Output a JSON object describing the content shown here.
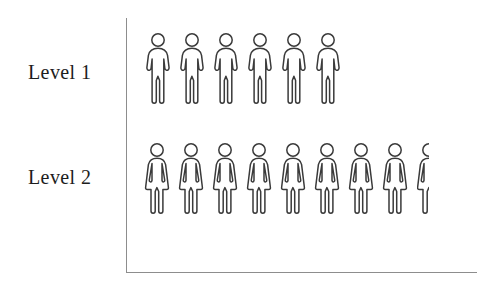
{
  "chart_data": {
    "type": "bar",
    "variant": "pictogram",
    "title": "",
    "subtitle": "",
    "xlabel": "",
    "ylabel": "",
    "orientation": "horizontal",
    "categories": [
      "Level 1",
      "Level 2"
    ],
    "values": [
      6,
      8.5
    ],
    "series": [
      {
        "name": "count",
        "values": [
          6,
          8.5
        ]
      }
    ],
    "icon_units": [
      {
        "category": "Level 1",
        "full_icons": 6,
        "half_icons": 0,
        "icon": "person-male-icon"
      },
      {
        "category": "Level 2",
        "full_icons": 8,
        "half_icons": 1,
        "icon": "person-female-icon"
      }
    ],
    "grid": false,
    "legend": false,
    "legend_position": "none",
    "axes": {
      "show_y_axis_line": true,
      "show_x_axis_line": true,
      "ticks": [],
      "tick_labels": []
    },
    "annotations": [],
    "colors": {
      "background": "#ffffff",
      "figure_stroke": "#3a3a3a",
      "figure_fill": "#ffffff",
      "axis": "#8d8d8d",
      "label_text": "#1d1d1d"
    }
  },
  "labels": {
    "level_1": "Level 1",
    "level_2": "Level 2"
  },
  "icons": {
    "male": "person-male-icon",
    "female": "person-female-icon",
    "female_half": "person-female-half-icon"
  }
}
